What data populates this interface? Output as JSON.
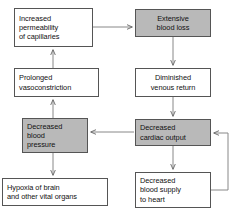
{
  "diagram": {
    "colors": {
      "shaded_fill": "#b9b9b9",
      "plain_fill": "#ffffff",
      "border": "#555555",
      "connector": "#666666",
      "text": "#111111"
    },
    "nodes": [
      {
        "id": "increased-permeability",
        "label": "Increased\npermeability\nof capillaries",
        "fill": "plain",
        "align": "left",
        "x": 14,
        "y": 8,
        "w": 79,
        "h": 39
      },
      {
        "id": "extensive-blood-loss",
        "label": "Extensive\nblood loss",
        "fill": "shaded",
        "align": "center",
        "x": 135,
        "y": 9,
        "w": 76,
        "h": 28
      },
      {
        "id": "prolonged-vasoconstriction",
        "label": "Prolonged\nvasoconstriction",
        "fill": "plain",
        "align": "left",
        "x": 14,
        "y": 68,
        "w": 85,
        "h": 29
      },
      {
        "id": "diminished-venous-return",
        "label": "Diminished\nvenous return",
        "fill": "plain",
        "align": "center",
        "x": 135,
        "y": 68,
        "w": 76,
        "h": 29
      },
      {
        "id": "decreased-blood-pressure",
        "label": "Decreased\nblood\npressure",
        "fill": "shaded",
        "align": "left",
        "x": 22,
        "y": 118,
        "w": 66,
        "h": 35
      },
      {
        "id": "decreased-cardiac-output",
        "label": "Decreased\ncardiac output",
        "fill": "shaded",
        "align": "left",
        "x": 135,
        "y": 119,
        "w": 76,
        "h": 27
      },
      {
        "id": "hypoxia-of-brain",
        "label": "Hypoxia of brain\nand other vital organs",
        "fill": "plain",
        "align": "left",
        "x": 2,
        "y": 178,
        "w": 106,
        "h": 28
      },
      {
        "id": "decreased-blood-supply-to-heart",
        "label": "Decreased\nblood supply\nto heart",
        "fill": "plain",
        "align": "left",
        "x": 135,
        "y": 172,
        "w": 76,
        "h": 36
      }
    ],
    "connectors": [
      {
        "id": "permeability-to-blood-loss",
        "from": "increased-permeability",
        "to": "extensive-blood-loss",
        "direction": "right"
      },
      {
        "id": "blood-loss-to-venous-return",
        "from": "extensive-blood-loss",
        "to": "diminished-venous-return",
        "direction": "down"
      },
      {
        "id": "venous-return-to-cardiac-output",
        "from": "diminished-venous-return",
        "to": "decreased-cardiac-output",
        "direction": "down"
      },
      {
        "id": "cardiac-output-to-blood-pressure",
        "from": "decreased-cardiac-output",
        "to": "decreased-blood-pressure",
        "direction": "left"
      },
      {
        "id": "blood-pressure-to-vasoconstriction",
        "from": "decreased-blood-pressure",
        "to": "prolonged-vasoconstriction",
        "direction": "up"
      },
      {
        "id": "vasoconstriction-to-permeability",
        "from": "prolonged-vasoconstriction",
        "to": "increased-permeability",
        "direction": "up"
      },
      {
        "id": "blood-pressure-to-hypoxia",
        "from": "decreased-blood-pressure",
        "to": "hypoxia-of-brain",
        "direction": "down"
      },
      {
        "id": "cardiac-output-to-blood-supply",
        "from": "decreased-cardiac-output",
        "to": "decreased-blood-supply-to-heart",
        "direction": "down"
      },
      {
        "id": "blood-supply-feedback-to-cardiac-output",
        "from": "decreased-blood-supply-to-heart",
        "to": "decreased-cardiac-output",
        "direction": "feedback-loop"
      }
    ]
  }
}
